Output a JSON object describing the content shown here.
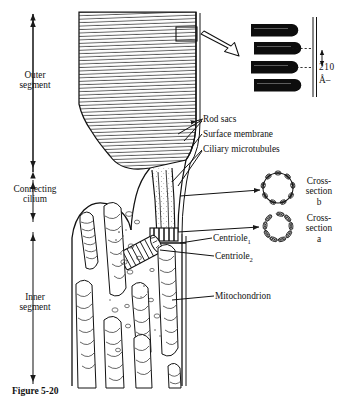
{
  "figure": {
    "title_caption": "Figure 5-20",
    "background_color": "#ffffff",
    "ink_color": "#111111"
  },
  "left_labels": [
    {
      "id": "outer-segment",
      "line1": "Outer",
      "line2": "segment"
    },
    {
      "id": "connecting-cilium",
      "line1": "Connecting",
      "line2": "cilium"
    },
    {
      "id": "inner-segment",
      "line1": "Inner",
      "line2": "segment"
    }
  ],
  "right_labels": [
    {
      "id": "rod-sacs",
      "text": "Rod sacs"
    },
    {
      "id": "surface-membrane",
      "text": "Surface membrane"
    },
    {
      "id": "ciliary-microtubules",
      "text": "Ciliary microtubules"
    },
    {
      "id": "mitochondrion",
      "text": "Mitochondrion"
    }
  ],
  "centriole_labels": [
    {
      "id": "centriole-1",
      "text": "Centriole",
      "subscript": "1"
    },
    {
      "id": "centriole-2",
      "text": "Centriole",
      "subscript": "2"
    }
  ],
  "cross_sections": [
    {
      "id": "cross-section-b",
      "line1": "Cross-",
      "line2": "section",
      "line3": "b",
      "units": 9,
      "kind": "doublet"
    },
    {
      "id": "cross-section-a",
      "line1": "Cross-",
      "line2": "section",
      "line3": "a",
      "units": 9,
      "kind": "triplet"
    }
  ],
  "scale_bar": {
    "id": "scale-210-angstrom",
    "value": "210",
    "unit": "Å",
    "trailing": "–"
  },
  "inset": {
    "id": "magnified-rod-sacs",
    "rod_count": 4,
    "description": "magnified rod sac discs"
  },
  "counts": {
    "mitochondria": 8,
    "disc_lamellae": 44
  }
}
